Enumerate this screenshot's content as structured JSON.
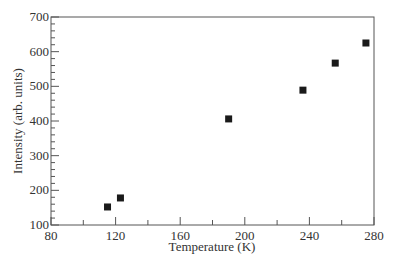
{
  "chart_data": {
    "type": "scatter",
    "title": "",
    "xlabel": "Temperature (K)",
    "ylabel": "Intensity (arb. units)",
    "xlim": [
      80,
      280
    ],
    "ylim": [
      100,
      700
    ],
    "xticks": [
      80,
      120,
      160,
      200,
      240,
      280
    ],
    "yticks": [
      100,
      200,
      300,
      400,
      500,
      600,
      700
    ],
    "x_minor_step": 20,
    "y_minor_step": 20,
    "grid": false,
    "legend": null,
    "marker": "square",
    "marker_color": "#1a1a1a",
    "series": [
      {
        "name": "Intensity",
        "x": [
          115,
          123,
          190,
          236,
          256,
          275
        ],
        "y": [
          152,
          178,
          406,
          489,
          567,
          625
        ]
      }
    ]
  }
}
